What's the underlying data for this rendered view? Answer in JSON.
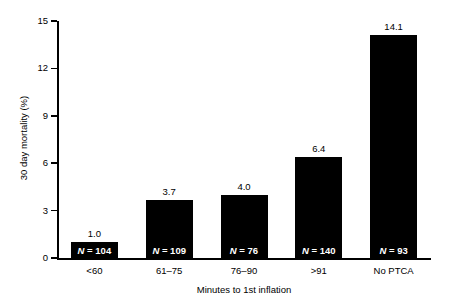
{
  "chart_data": {
    "type": "bar",
    "title": "",
    "xlabel": "Minutes to 1st inflation",
    "ylabel": "30 day mortality (%)",
    "categories": [
      "<60",
      "61–75",
      "76–90",
      ">91",
      "No PTCA"
    ],
    "values": [
      1.0,
      3.7,
      4.0,
      6.4,
      14.1
    ],
    "value_labels": [
      "1.0",
      "3.7",
      "4.0",
      "6.4",
      "14.1"
    ],
    "n_labels": [
      "N = 104",
      "N = 109",
      "N = 76",
      "N = 140",
      "N = 93"
    ],
    "n_values": [
      104,
      109,
      76,
      140,
      93
    ],
    "ylim": [
      0,
      15
    ],
    "yticks": [
      0,
      3,
      6,
      9,
      12,
      15
    ],
    "ytick_labels": [
      "0",
      "3",
      "6",
      "9",
      "12",
      "15"
    ],
    "grid": false,
    "legend": null,
    "bar_color": "#000000",
    "text_color": "#000000",
    "background_color": "#ffffff"
  }
}
